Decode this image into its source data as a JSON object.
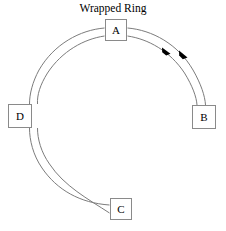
{
  "diagram": {
    "title": "Wrapped Ring",
    "type": "ring-network-topology",
    "background_color": "#ffffff",
    "geometry": {
      "canvas_width": 226,
      "canvas_height": 231,
      "center_x": 116,
      "center_y": 125,
      "outer_radius": 97,
      "inner_radius": 88
    },
    "ring": {
      "stroke_color": "#7c7c7c",
      "stroke_width": 1,
      "direction": "clockwise",
      "arc_count": 2,
      "description": "two concentric arcs wrapped around forming an open ring"
    },
    "nodes": [
      {
        "id": "A",
        "label": "A",
        "position": "top",
        "x": 105,
        "y": 19,
        "width": 22,
        "height": 22,
        "fill": "#ffffff",
        "border_color": "#8a8a8a"
      },
      {
        "id": "B",
        "label": "B",
        "position": "right",
        "x": 192,
        "y": 105,
        "width": 24,
        "height": 24,
        "fill": "#ffffff",
        "border_color": "#8a8a8a"
      },
      {
        "id": "C",
        "label": "C",
        "position": "bottom",
        "x": 110,
        "y": 198,
        "width": 22,
        "height": 22,
        "fill": "#ffffff",
        "border_color": "#8a8a8a"
      },
      {
        "id": "D",
        "label": "D",
        "position": "left",
        "x": 8,
        "y": 104,
        "width": 24,
        "height": 24,
        "fill": "#ffffff",
        "border_color": "#8a8a8a"
      }
    ],
    "arrows": [
      {
        "id": "arrow-inner",
        "x": 166,
        "y": 52,
        "direction": "clockwise",
        "color": "#000000"
      },
      {
        "id": "arrow-outer",
        "x": 183,
        "y": 56,
        "direction": "clockwise",
        "color": "#000000"
      }
    ]
  }
}
